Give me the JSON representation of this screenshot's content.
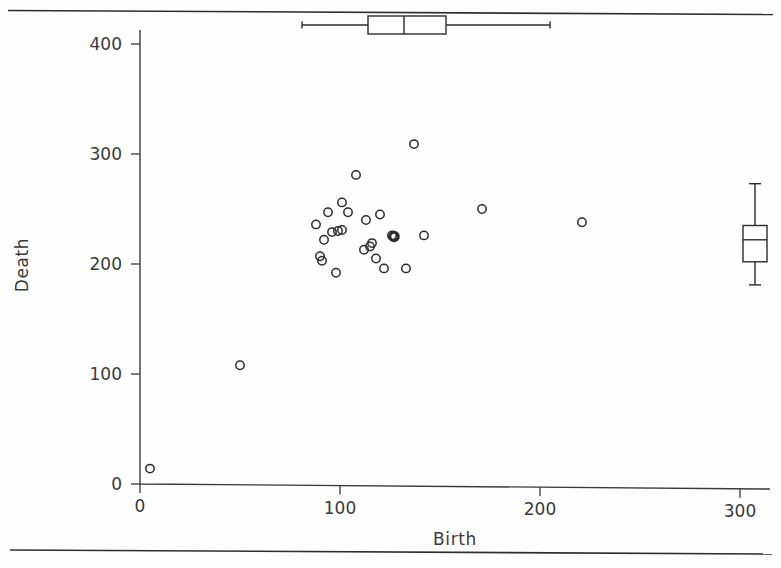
{
  "figure": {
    "background_color": "#fefefe",
    "ink_color": "#2b2b2b",
    "top_rule_label": "top-horizontal-rule",
    "bottom_rule_label": "bottom-horizontal-rule"
  },
  "chart_data": {
    "type": "scatter",
    "title": "",
    "xlabel": "Birth",
    "ylabel": "Death",
    "xlim": [
      -5,
      320
    ],
    "ylim": [
      -15,
      430
    ],
    "xticks": [
      0,
      100,
      200,
      300
    ],
    "yticks": [
      0,
      100,
      200,
      300,
      400
    ],
    "xtick_labels": [
      "0",
      "100",
      "200",
      "300"
    ],
    "ytick_labels": [
      "0",
      "100",
      "200",
      "300",
      "400"
    ],
    "grid": false,
    "legend": null,
    "marker_style": "open-circle",
    "points": [
      {
        "x": 5,
        "y": 14
      },
      {
        "x": 50,
        "y": 108
      },
      {
        "x": 88,
        "y": 236
      },
      {
        "x": 90,
        "y": 207
      },
      {
        "x": 91,
        "y": 203
      },
      {
        "x": 92,
        "y": 222
      },
      {
        "x": 94,
        "y": 247
      },
      {
        "x": 96,
        "y": 229
      },
      {
        "x": 98,
        "y": 192
      },
      {
        "x": 99,
        "y": 230
      },
      {
        "x": 101,
        "y": 231
      },
      {
        "x": 101,
        "y": 256
      },
      {
        "x": 104,
        "y": 247
      },
      {
        "x": 108,
        "y": 281
      },
      {
        "x": 112,
        "y": 213
      },
      {
        "x": 113,
        "y": 240
      },
      {
        "x": 115,
        "y": 216
      },
      {
        "x": 116,
        "y": 219
      },
      {
        "x": 118,
        "y": 205
      },
      {
        "x": 120,
        "y": 245
      },
      {
        "x": 122,
        "y": 196
      },
      {
        "x": 126,
        "y": 226
      },
      {
        "x": 127,
        "y": 225,
        "emphasis": true
      },
      {
        "x": 133,
        "y": 196
      },
      {
        "x": 137,
        "y": 309
      },
      {
        "x": 142,
        "y": 226
      },
      {
        "x": 171,
        "y": 250
      },
      {
        "x": 221,
        "y": 238
      }
    ],
    "marginal_boxplots": [
      {
        "name": "birth-marginal-boxplot",
        "orientation": "horizontal",
        "variable": "Birth",
        "whisker_low": 81,
        "q1": 114,
        "median": 132,
        "q3": 153,
        "whisker_high": 205
      },
      {
        "name": "death-marginal-boxplot",
        "orientation": "vertical",
        "variable": "Death",
        "whisker_low": 181,
        "q1": 202,
        "median": 222,
        "q3": 235,
        "whisker_high": 273
      }
    ]
  }
}
